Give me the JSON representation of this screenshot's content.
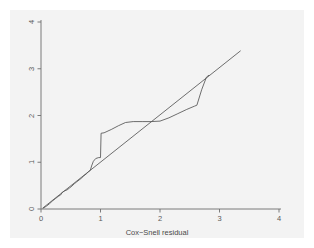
{
  "figure": {
    "width": 314,
    "height": 248,
    "background_color": "#ffffff",
    "panel_color": "#f3f3f3",
    "axis_color": "#6e6e6e",
    "line_color": "#555555"
  },
  "chart_data": {
    "type": "line",
    "title": "",
    "subtitle": "",
    "xlabel": "Cox−Snell residual",
    "ylabel": "",
    "xlim": [
      0,
      4
    ],
    "ylim": [
      0,
      4
    ],
    "xticks": [
      0,
      1,
      2,
      3,
      4
    ],
    "xtick_labels": [
      "0",
      "1",
      "2",
      "3",
      "4"
    ],
    "yticks": [
      0,
      1,
      2,
      3,
      4
    ],
    "ytick_labels": [
      "0",
      "1",
      "2",
      "3",
      "4"
    ],
    "ytick_label_rotation": 90,
    "grid": false,
    "legend": null,
    "legend_position": "none",
    "annotations": [],
    "series": [
      {
        "name": "Nelson-Aalen cumulative hazard",
        "style": "step-like piecewise line",
        "color": "#555555",
        "points": [
          [
            0.04,
            0.02
          ],
          [
            0.09,
            0.06
          ],
          [
            0.14,
            0.11
          ],
          [
            0.19,
            0.17
          ],
          [
            0.24,
            0.22
          ],
          [
            0.29,
            0.27
          ],
          [
            0.33,
            0.3
          ],
          [
            0.36,
            0.36
          ],
          [
            0.4,
            0.39
          ],
          [
            0.44,
            0.41
          ],
          [
            0.48,
            0.45
          ],
          [
            0.52,
            0.49
          ],
          [
            0.56,
            0.54
          ],
          [
            0.6,
            0.58
          ],
          [
            0.64,
            0.62
          ],
          [
            0.68,
            0.66
          ],
          [
            0.72,
            0.71
          ],
          [
            0.76,
            0.75
          ],
          [
            0.8,
            0.8
          ],
          [
            0.83,
            0.83
          ],
          [
            0.85,
            0.92
          ],
          [
            0.88,
            1.02
          ],
          [
            0.92,
            1.08
          ],
          [
            0.97,
            1.1
          ],
          [
            1.0,
            1.1
          ],
          [
            1.01,
            1.62
          ],
          [
            1.06,
            1.63
          ],
          [
            1.18,
            1.7
          ],
          [
            1.3,
            1.78
          ],
          [
            1.42,
            1.85
          ],
          [
            1.55,
            1.87
          ],
          [
            1.7,
            1.87
          ],
          [
            1.85,
            1.87
          ],
          [
            2.0,
            1.88
          ],
          [
            2.15,
            1.95
          ],
          [
            2.3,
            2.04
          ],
          [
            2.45,
            2.13
          ],
          [
            2.58,
            2.2
          ],
          [
            2.62,
            2.22
          ],
          [
            2.7,
            2.55
          ],
          [
            2.78,
            2.82
          ],
          [
            2.82,
            2.86
          ]
        ]
      },
      {
        "name": "Reference line (slope 1)",
        "style": "straight diagonal",
        "color": "#555555",
        "points": [
          [
            0.03,
            0.02
          ],
          [
            3.35,
            3.38
          ]
        ]
      }
    ]
  },
  "axes_geometry": {
    "plot_left_px": 41,
    "plot_right_px": 279,
    "plot_top_px": 22,
    "plot_bottom_px": 209,
    "px_per_x_unit": 59.5,
    "px_per_y_unit": 46.75
  }
}
